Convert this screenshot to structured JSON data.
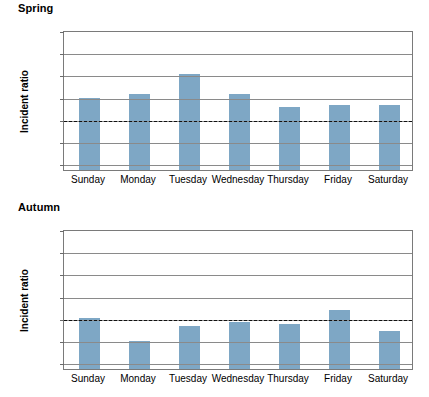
{
  "figure": {
    "bar_color": "#7ea7c5",
    "gridline_color": "#8a8a8a",
    "reference_line_color": "#111111"
  },
  "panels": [
    {
      "id": "spring",
      "title": "Spring",
      "ylabel": "Incident ratio",
      "zero_tick": "0"
    },
    {
      "id": "autumn",
      "title": "Autumn",
      "ylabel": "Incident ratio",
      "zero_tick": "0"
    }
  ],
  "y_ticks": [
    "1.20",
    "1.15",
    "1.10",
    "1.05",
    "1.00",
    "0.95",
    "0.90"
  ],
  "categories": [
    "Sunday",
    "Monday",
    "Tuesday",
    "Wednesday",
    "Thursday",
    "Friday",
    "Saturday"
  ],
  "chart_data": [
    {
      "type": "bar",
      "title": "Spring",
      "xlabel": "",
      "ylabel": "Incident ratio",
      "categories": [
        "Sunday",
        "Monday",
        "Tuesday",
        "Wednesday",
        "Thursday",
        "Friday",
        "Saturday"
      ],
      "values": [
        1.047,
        1.057,
        1.1,
        1.055,
        1.026,
        1.032,
        1.031
      ],
      "ylim": [
        0.885,
        1.2
      ],
      "yticks": [
        0.9,
        0.95,
        1.0,
        1.05,
        1.1,
        1.15,
        1.2
      ],
      "ytick_labels": [
        "0.90",
        "0.95",
        "1.00",
        "1.05",
        "1.10",
        "1.15",
        "1.20"
      ],
      "axis_break": true,
      "zero_tick_label": "0",
      "reference_line": 1.0,
      "reference_line_style": "dashed",
      "grid": true,
      "legend": "none"
    },
    {
      "type": "bar",
      "title": "Autumn",
      "xlabel": "",
      "ylabel": "Incident ratio",
      "categories": [
        "Sunday",
        "Monday",
        "Tuesday",
        "Wednesday",
        "Thursday",
        "Friday",
        "Saturday"
      ],
      "values": [
        0.999,
        0.949,
        0.982,
        0.99,
        0.986,
        1.017,
        0.971
      ],
      "ylim": [
        0.885,
        1.2
      ],
      "yticks": [
        0.9,
        0.95,
        1.0,
        1.05,
        1.1,
        1.15,
        1.2
      ],
      "ytick_labels": [
        "0.90",
        "0.95",
        "1.00",
        "1.05",
        "1.10",
        "1.15",
        "1.20"
      ],
      "axis_break": true,
      "zero_tick_label": "0",
      "reference_line": 1.0,
      "reference_line_style": "dashed",
      "grid": true,
      "legend": "none"
    }
  ]
}
